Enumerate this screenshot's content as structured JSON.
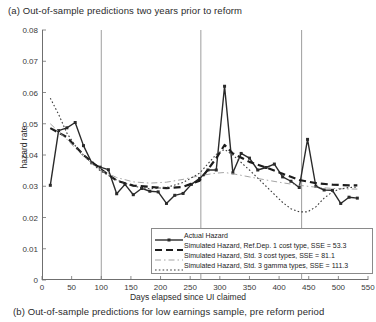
{
  "figure": {
    "caption_top": "(a) Out-of-sample predictions two years prior to reform",
    "caption_bottom": "(b) Out-of-sample predictions for low earnings sample, pre reform period"
  },
  "chart_data": {
    "type": "line",
    "title": "(a) Out-of-sample predictions two years prior to reform",
    "xlabel": "Days elapsed since UI claimed",
    "ylabel": "hazard rate",
    "xlim": [
      0,
      550
    ],
    "ylim": [
      0,
      0.08
    ],
    "xticks": [
      0,
      50,
      100,
      150,
      200,
      250,
      300,
      350,
      400,
      450,
      500,
      550
    ],
    "yticks": [
      0,
      0.01,
      0.02,
      0.03,
      0.04,
      0.05,
      0.06,
      0.07,
      0.08
    ],
    "ytick_labels": [
      "0",
      "0.01",
      "0.02",
      "0.03",
      "0.04",
      "0.05",
      "0.06",
      "0.07",
      "0.08"
    ],
    "grid": false,
    "legend_position": "lower right",
    "vertical_reference_lines": [
      100,
      268,
      438
    ],
    "series": [
      {
        "name": "Actual Hazard",
        "style": "solid-marker",
        "color": "#2a2a2a",
        "x": [
          14,
          28,
          42,
          56,
          70,
          84,
          98,
          112,
          126,
          140,
          154,
          168,
          182,
          196,
          210,
          224,
          238,
          252,
          266,
          280,
          294,
          308,
          322,
          336,
          350,
          364,
          378,
          392,
          406,
          420,
          434,
          448,
          462,
          476,
          490,
          504,
          518,
          532
        ],
        "y": [
          0.0303,
          0.0478,
          0.0487,
          0.0504,
          0.043,
          0.0375,
          0.0361,
          0.0353,
          0.0276,
          0.0306,
          0.0273,
          0.0293,
          0.0284,
          0.0282,
          0.0245,
          0.0271,
          0.0277,
          0.0306,
          0.0325,
          0.0352,
          0.0352,
          0.062,
          0.0343,
          0.0405,
          0.039,
          0.0352,
          0.036,
          0.0371,
          0.033,
          0.0316,
          0.0296,
          0.045,
          0.03,
          0.0288,
          0.0287,
          0.0245,
          0.0265,
          0.0262
        ]
      },
      {
        "name": "Simulated Hazard, Ref.Dep. 1 cost type, SSE = 53.3",
        "style": "dashed-thick",
        "color": "#1c1c1c",
        "sse": 53.3,
        "x": [
          14,
          42,
          70,
          98,
          126,
          154,
          182,
          210,
          238,
          266,
          294,
          308,
          322,
          350,
          378,
          406,
          434,
          462,
          490,
          518,
          532
        ],
        "y": [
          0.0486,
          0.0457,
          0.04,
          0.0356,
          0.0318,
          0.0302,
          0.0298,
          0.0294,
          0.0298,
          0.0318,
          0.039,
          0.0432,
          0.0405,
          0.0378,
          0.036,
          0.034,
          0.032,
          0.031,
          0.0305,
          0.0303,
          0.0303
        ]
      },
      {
        "name": "Simulated Hazard, Std. 3 cost types, SSE = 81.1",
        "style": "dash-dot-thin",
        "color": "#9a9a9a",
        "sse": 81.1,
        "x": [
          14,
          42,
          70,
          98,
          126,
          154,
          182,
          210,
          238,
          266,
          294,
          308,
          322,
          350,
          378,
          406,
          434,
          462,
          490,
          518,
          532
        ],
        "y": [
          0.05,
          0.045,
          0.0395,
          0.0352,
          0.0328,
          0.0314,
          0.031,
          0.0313,
          0.0322,
          0.0334,
          0.0342,
          0.0344,
          0.034,
          0.033,
          0.032,
          0.0311,
          0.0303,
          0.0297,
          0.0293,
          0.0291,
          0.0291
        ]
      },
      {
        "name": "Simulated Hazard, Std. 3 gamma types, SSE = 111.3",
        "style": "dotted",
        "color": "#3a3a3a",
        "sse": 111.3,
        "x": [
          14,
          28,
          42,
          56,
          70,
          98,
          126,
          154,
          182,
          210,
          238,
          266,
          294,
          308,
          322,
          350,
          378,
          406,
          420,
          434,
          448,
          462,
          476,
          490,
          504,
          518,
          532
        ],
        "y": [
          0.0582,
          0.053,
          0.047,
          0.043,
          0.04,
          0.035,
          0.032,
          0.03,
          0.0292,
          0.0296,
          0.0312,
          0.0342,
          0.0402,
          0.0418,
          0.04,
          0.0352,
          0.03,
          0.0248,
          0.0228,
          0.0218,
          0.0218,
          0.0234,
          0.0262,
          0.0282,
          0.0292,
          0.0296,
          0.0297
        ]
      }
    ]
  },
  "legend": {
    "entries": [
      {
        "label": "Actual Hazard"
      },
      {
        "label": "Simulated Hazard, Ref.Dep. 1 cost type, SSE = 53.3"
      },
      {
        "label": "Simulated Hazard, Std. 3 cost types, SSE = 81.1"
      },
      {
        "label": "Simulated Hazard, Std. 3 gamma types, SSE = 111.3"
      }
    ]
  }
}
